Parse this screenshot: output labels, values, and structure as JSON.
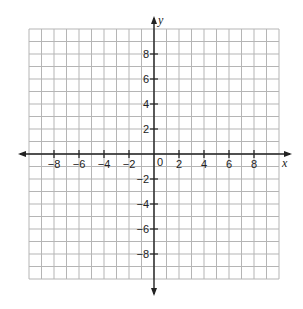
{
  "chart_data": {
    "type": "scatter",
    "title": "",
    "xlabel": "x",
    "ylabel": "y",
    "xlim": [
      -10,
      10
    ],
    "ylim": [
      -10,
      10
    ],
    "grid": true,
    "grid_step": 1,
    "x_ticks": [
      -8,
      -6,
      -4,
      -2,
      2,
      4,
      6,
      8
    ],
    "y_ticks": [
      8,
      6,
      4,
      2,
      -2,
      -4,
      -6,
      -8
    ],
    "x_tick_labels": [
      "−8",
      "−6",
      "−4",
      "−2",
      "2",
      "4",
      "6",
      "8"
    ],
    "y_tick_labels": [
      "8",
      "6",
      "4",
      "2",
      "−2",
      "−4",
      "−6",
      "−8"
    ],
    "origin_label": "0",
    "series": []
  },
  "colors": {
    "grid": "#b5b5b5",
    "axis": "#222222",
    "background": "#ffffff"
  }
}
